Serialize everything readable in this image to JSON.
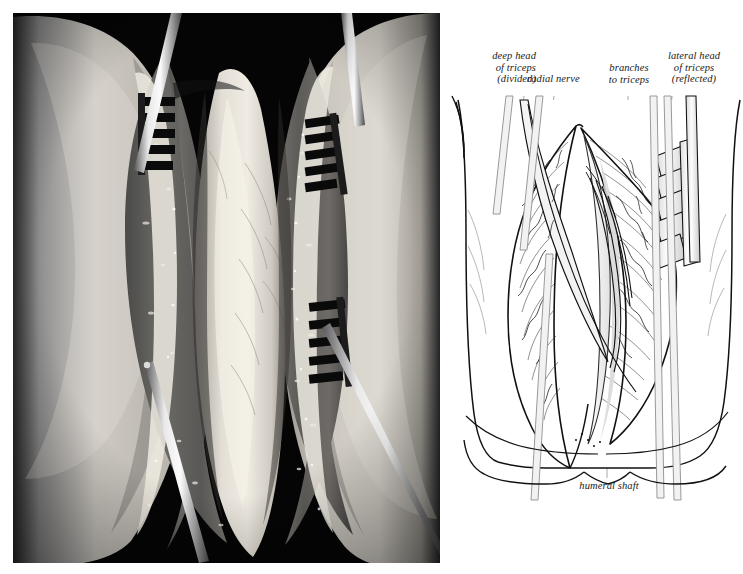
{
  "figure": {
    "kind": "surgical-approach-figure",
    "background_color": "#ffffff",
    "panels": [
      {
        "name": "intraoperative-photograph",
        "type": "black-and-white-photo"
      },
      {
        "name": "line-drawing",
        "type": "ink-line-illustration"
      }
    ]
  },
  "photo": {
    "border_color": "#000000",
    "description_tone": "grayscale",
    "instruments": [
      {
        "name": "rake-retractor-upper-left",
        "tines": 5
      },
      {
        "name": "rake-retractor-upper-right",
        "tines": 5
      },
      {
        "name": "rake-retractor-lower-right",
        "tines": 5
      },
      {
        "name": "retractor-handle-upper-left"
      },
      {
        "name": "retractor-handle-upper-right"
      },
      {
        "name": "retractor-handle-lower-right"
      },
      {
        "name": "retractor-handle-lower-left"
      }
    ]
  },
  "diagram": {
    "ink_color": "#111111",
    "fill_color": "#ffffff",
    "leader_color": "#8d8d8d",
    "labels": [
      {
        "id": "deep-head-of-triceps",
        "lines": [
          "deep head",
          "of triceps",
          "(divided)"
        ],
        "align": "right"
      },
      {
        "id": "radial-nerve",
        "lines": [
          "radial nerve"
        ],
        "align": "left"
      },
      {
        "id": "branches-to-triceps",
        "lines": [
          "branches",
          "to triceps"
        ],
        "align": "center"
      },
      {
        "id": "lateral-head-of-triceps",
        "lines": [
          "lateral head",
          "of triceps",
          "(reflected)"
        ],
        "align": "center"
      },
      {
        "id": "humeral-shaft",
        "lines": [
          "humeral shaft"
        ],
        "align": "center"
      }
    ],
    "structures": [
      "arm outline",
      "wound edges",
      "deep head of triceps (divided)",
      "lateral head of triceps (reflected)",
      "radial nerve",
      "branches to triceps",
      "humeral shaft",
      "rake retractor"
    ]
  },
  "label_text": {
    "deep_head_l1": "deep head",
    "deep_head_l2": "of triceps",
    "deep_head_l3": "(divided)",
    "radial_nerve": "radial nerve",
    "branches_l1": "branches",
    "branches_l2": "to triceps",
    "lateral_head_l1": "lateral head",
    "lateral_head_l2": "of triceps",
    "lateral_head_l3": "(reflected)",
    "humeral_shaft": "humeral shaft"
  }
}
